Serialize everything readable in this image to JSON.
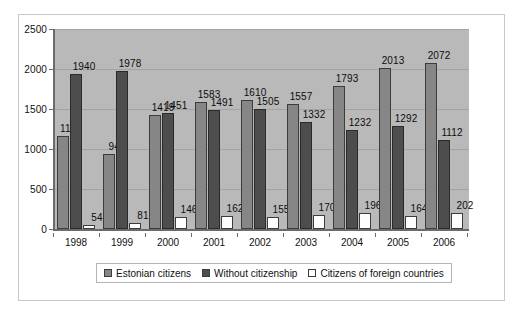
{
  "chart_data": {
    "type": "bar",
    "title": "",
    "subtitle": "",
    "xlabel": "",
    "ylabel": "",
    "categories": [
      "1998",
      "1999",
      "2000",
      "2001",
      "2002",
      "2003",
      "2004",
      "2005",
      "2006"
    ],
    "series": [
      {
        "name": "Estonian citizens",
        "color": "#868686",
        "values": [
          1165,
          940,
          1419,
          1583,
          1610,
          1557,
          1793,
          2013,
          2072
        ]
      },
      {
        "name": "Without citizenship",
        "color": "#4d4d4d",
        "values": [
          1940,
          1978,
          1451,
          1491,
          1505,
          1332,
          1232,
          1292,
          1112
        ]
      },
      {
        "name": "Citizens of foreign countries",
        "color": "#fdfdfd",
        "values": [
          54,
          81,
          146,
          162,
          155,
          170,
          196,
          164,
          202
        ]
      }
    ],
    "ylim": [
      0,
      2500
    ],
    "yticks": [
      0,
      500,
      1000,
      1500,
      2000,
      2500
    ],
    "ytick_labels": [
      "0",
      "500",
      "1000",
      "1500",
      "2000",
      "2500"
    ],
    "grid": true,
    "legend_position": "bottom",
    "data_labels": true,
    "plot_background": "#b9b9b9"
  }
}
